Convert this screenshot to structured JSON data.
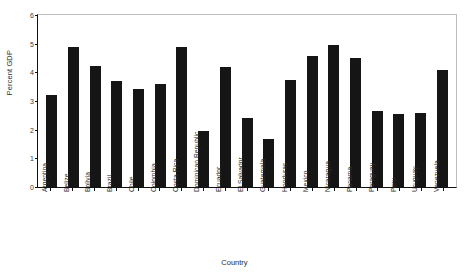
{
  "chart_data": {
    "type": "bar",
    "title": "",
    "xlabel": "Country",
    "ylabel": "Percent GDP",
    "ylim": [
      0,
      6
    ],
    "yticks": [
      0,
      1,
      2,
      3,
      4,
      5,
      6
    ],
    "grid": false,
    "legend": null,
    "bar_color": "#151515",
    "categories": [
      "Argentina",
      "Belize",
      "Bolivia",
      "Brazil",
      "Chile",
      "Colombia",
      "Costa Rica",
      "Dominican Republic",
      "Ecuador",
      "El Salvador",
      "Guatemala",
      "Honduras",
      "Mexico",
      "Nicaragua",
      "Panama",
      "Paraguay",
      "Peru",
      "Uruguay",
      "Venezuela"
    ],
    "values": [
      3.2,
      4.87,
      4.22,
      3.69,
      3.43,
      3.6,
      4.9,
      1.96,
      4.2,
      2.41,
      1.68,
      3.73,
      4.57,
      4.95,
      4.49,
      2.64,
      2.53,
      2.58,
      4.08
    ]
  }
}
